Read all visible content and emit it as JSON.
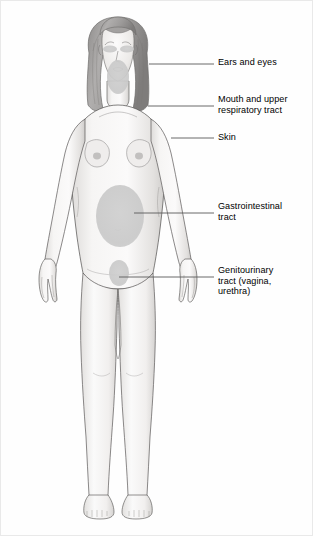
{
  "diagram": {
    "colors": {
      "background": "#fefefe",
      "outline": "#4a4a4a",
      "skin_light": "#f4f3f2",
      "skin_shadow": "#d9d7d5",
      "hair": "#a6a4a3",
      "hair_dark": "#7c7a79",
      "highlight_region": "#c9c9c9",
      "leader_line": "#5a5a5a",
      "text": "#000000"
    },
    "labels": [
      {
        "id": "ears-and-eyes",
        "text": "Ears and eyes",
        "text_x": 217,
        "text_y": 60,
        "leader": {
          "x1": 148,
          "y1": 63,
          "x2": 213,
          "y2": 63
        }
      },
      {
        "id": "mouth-and-upper-respiratory-tract",
        "text": "Mouth and upper\nrespiratory tract",
        "text_x": 217,
        "text_y": 94,
        "leader": {
          "x1": 147,
          "y1": 105,
          "x2": 213,
          "y2": 105
        }
      },
      {
        "id": "skin",
        "text": "Skin",
        "text_x": 217,
        "text_y": 132,
        "leader": {
          "x1": 170,
          "y1": 137,
          "x2": 213,
          "y2": 137
        }
      },
      {
        "id": "gastrointestinal-tract",
        "text": "Gastrointestinal\ntract",
        "text_x": 217,
        "text_y": 201,
        "leader": {
          "x1": 133,
          "y1": 212,
          "x2": 213,
          "y2": 212
        }
      },
      {
        "id": "genitourinary-tract",
        "text": "Genitourinary\ntract (vagina,\nurethra)",
        "text_x": 217,
        "text_y": 265,
        "leader": {
          "x1": 118,
          "y1": 276,
          "x2": 213,
          "y2": 276
        }
      }
    ],
    "highlight_regions": [
      {
        "id": "eye-left",
        "cx": 109,
        "cy": 48,
        "rx": 7,
        "ry": 3.6
      },
      {
        "id": "eye-right",
        "cx": 126,
        "cy": 48,
        "rx": 7,
        "ry": 3.6
      },
      {
        "id": "mouth-and-throat",
        "cx": 117,
        "cy": 76,
        "rx": 11,
        "ry": 17
      },
      {
        "id": "gastrointestinal-abdomen",
        "cx": 119,
        "cy": 215,
        "rx": 24,
        "ry": 31
      },
      {
        "id": "genitourinary-pelvis",
        "cx": 118,
        "cy": 272,
        "rx": 10,
        "ry": 13
      }
    ]
  }
}
